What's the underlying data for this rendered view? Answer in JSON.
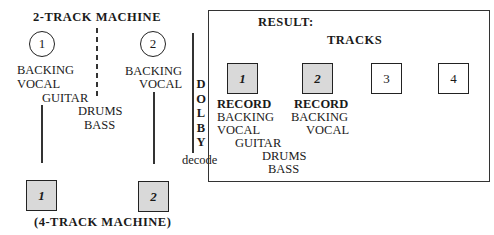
{
  "diagram": {
    "title": "2-TRACK MACHINE",
    "footer": "(4-TRACK MACHINE)",
    "source_tracks": [
      {
        "number": "1",
        "lines": [
          "BACKING",
          "VOCAL",
          "GUITAR"
        ]
      },
      {
        "number": "2",
        "lines": [
          "BACKING",
          "VOCAL"
        ]
      }
    ],
    "middle_labels": [
      "DRUMS",
      "BASS"
    ],
    "destination_tracks": [
      "1",
      "2"
    ],
    "dolby": {
      "letters": [
        "D",
        "O",
        "L",
        "B",
        "Y"
      ],
      "label": "decode"
    },
    "result": {
      "title": "RESULT:",
      "tracks_label": "TRACKS",
      "tracks": [
        {
          "number": "1",
          "shaded": true,
          "record_label": "RECORD",
          "lines": [
            "BACKING",
            "VOCAL",
            "GUITAR",
            "DRUMS",
            "BASS"
          ]
        },
        {
          "number": "2",
          "shaded": true,
          "record_label": "RECORD",
          "lines": [
            "BACKING",
            "VOCAL"
          ]
        },
        {
          "number": "3",
          "shaded": false
        },
        {
          "number": "4",
          "shaded": false
        }
      ]
    }
  }
}
